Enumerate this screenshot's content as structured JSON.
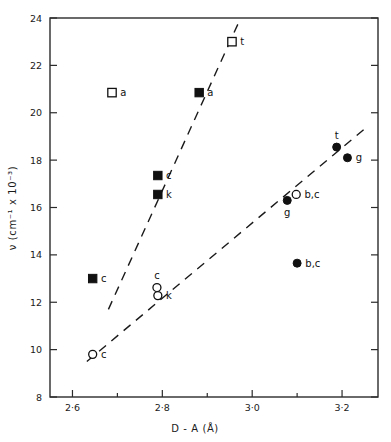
{
  "chart_data": {
    "type": "scatter",
    "title": "",
    "xlabel": "D - A  (Å)",
    "ylabel": "ν (cm⁻¹ x 10⁻³)",
    "xlim": [
      2.55,
      3.28
    ],
    "ylim": [
      8,
      24
    ],
    "xticks": [
      2.6,
      2.8,
      3.0,
      3.2
    ],
    "xtick_labels": [
      "2·6",
      "2·8",
      "3·0",
      "3·2"
    ],
    "xminor_ticks": [
      2.7,
      2.9,
      3.1
    ],
    "yticks": [
      8,
      10,
      12,
      14,
      16,
      18,
      20,
      22,
      24
    ],
    "ytick_labels": [
      "8",
      "10",
      "12",
      "14",
      "16",
      "18",
      "20",
      "22",
      "24"
    ],
    "grid": false,
    "legend": "none",
    "series": [
      {
        "name": "open-square",
        "marker": "open-square",
        "points": [
          {
            "x": 2.688,
            "y": 20.85,
            "label": "a",
            "label_pos": "right"
          },
          {
            "x": 2.955,
            "y": 23.0,
            "label": "t",
            "label_pos": "right"
          }
        ]
      },
      {
        "name": "filled-square",
        "marker": "filled-square",
        "points": [
          {
            "x": 2.645,
            "y": 13.0,
            "label": "c",
            "label_pos": "right"
          },
          {
            "x": 2.79,
            "y": 17.35,
            "label": "c",
            "label_pos": "right"
          },
          {
            "x": 2.79,
            "y": 16.55,
            "label": "k",
            "label_pos": "right"
          },
          {
            "x": 2.882,
            "y": 20.85,
            "label": "a",
            "label_pos": "right"
          }
        ]
      },
      {
        "name": "open-circle",
        "marker": "open-circle",
        "points": [
          {
            "x": 2.645,
            "y": 9.8,
            "label": "c",
            "label_pos": "right"
          },
          {
            "x": 2.788,
            "y": 12.62,
            "label": "c",
            "label_pos": "above"
          },
          {
            "x": 2.79,
            "y": 12.28,
            "label": "k",
            "label_pos": "right"
          },
          {
            "x": 3.098,
            "y": 16.55,
            "label": "b,c",
            "label_pos": "right"
          }
        ]
      },
      {
        "name": "filled-circle",
        "marker": "filled-circle",
        "points": [
          {
            "x": 3.078,
            "y": 16.3,
            "label": "g",
            "label_pos": "below"
          },
          {
            "x": 3.1,
            "y": 13.65,
            "label": "b,c",
            "label_pos": "right"
          },
          {
            "x": 3.188,
            "y": 18.55,
            "label": "t",
            "label_pos": "above"
          },
          {
            "x": 3.212,
            "y": 18.1,
            "label": "g",
            "label_pos": "right"
          }
        ]
      }
    ],
    "trendlines": [
      {
        "name": "upper-trend",
        "x1": 2.68,
        "y1": 11.7,
        "x2": 2.972,
        "y2": 23.9,
        "style": "dashed"
      },
      {
        "name": "lower-trend",
        "x1": 2.632,
        "y1": 9.5,
        "x2": 3.252,
        "y2": 19.35,
        "style": "dashed"
      }
    ]
  }
}
